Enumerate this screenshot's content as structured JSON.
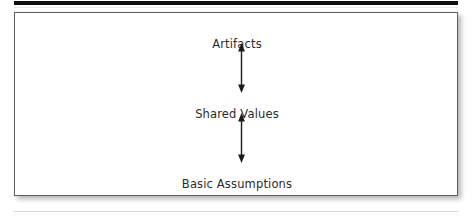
{
  "page": {
    "top_rule_color": "#0d0d0d",
    "bottom_rule_color": "#d9dadc",
    "background_color": "#ffffff"
  },
  "figure": {
    "border_color": "#5b5f63",
    "fill_color": "#ffffff",
    "text_color": "#2b2b2b",
    "nodes": [
      {
        "label": "Artifacts"
      },
      {
        "label": "Shared Values"
      },
      {
        "label": "Basic Assumptions"
      }
    ],
    "connectors": [
      {
        "name": "artifacts-to-shared-values",
        "style": "double-headed-arrow"
      },
      {
        "name": "shared-values-to-basic-assumptions",
        "style": "double-headed-arrow"
      }
    ]
  }
}
